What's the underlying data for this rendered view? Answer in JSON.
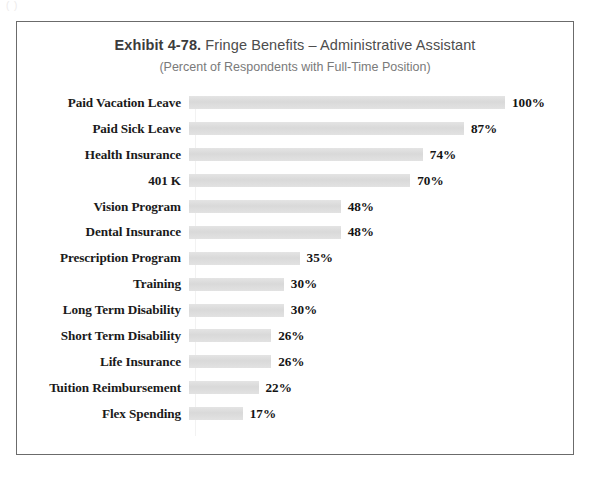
{
  "scan_artifact_text": "(             )",
  "chart_data": {
    "type": "bar",
    "orientation": "horizontal",
    "title": "Exhibit 4-78.  Fringe Benefits – Administrative Assistant",
    "title_exhibit": "Exhibit 4-78.",
    "title_rest": "Fringe Benefits – Administrative Assistant",
    "subtitle": "(Percent of Respondents with Full-Time Position)",
    "xlabel": "",
    "ylabel": "",
    "xlim": [
      0,
      100
    ],
    "grid": false,
    "legend": "none",
    "value_suffix": "%",
    "bar_color": "#dedede",
    "categories": [
      "Paid Vacation Leave",
      "Paid Sick Leave",
      "Health Insurance",
      "401 K",
      "Vision Program",
      "Dental Insurance",
      "Prescription Program",
      "Training",
      "Long Term Disability",
      "Short Term Disability",
      "Life Insurance",
      "Tuition Reimbursement",
      "Flex Spending"
    ],
    "values": [
      100,
      87,
      74,
      70,
      48,
      48,
      35,
      30,
      30,
      26,
      26,
      22,
      17
    ],
    "value_labels": [
      "100%",
      "87%",
      "74%",
      "70%",
      "48%",
      "48%",
      "35%",
      "30%",
      "30%",
      "26%",
      "26%",
      "22%",
      "17%"
    ],
    "series": [
      {
        "name": "Percent of Respondents with Full-Time Position",
        "values": [
          100,
          87,
          74,
          70,
          48,
          48,
          35,
          30,
          30,
          26,
          26,
          22,
          17
        ]
      }
    ]
  }
}
